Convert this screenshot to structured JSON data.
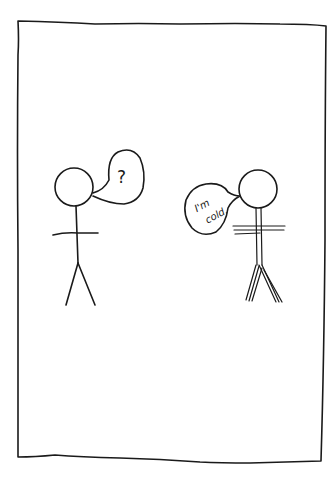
{
  "comic": {
    "panel": {
      "background": "#ffffff",
      "ink_color": "#1a1a1a"
    },
    "characters": [
      {
        "id": "left",
        "style": "single-line stick figure",
        "speech_bubble": {
          "type": "thought/speech",
          "text": "?"
        }
      },
      {
        "id": "right",
        "style": "double/triple-line stick figure (shivering)",
        "speech_bubble": {
          "type": "speech",
          "line1": "I'm",
          "line2": "cold."
        }
      }
    ]
  }
}
